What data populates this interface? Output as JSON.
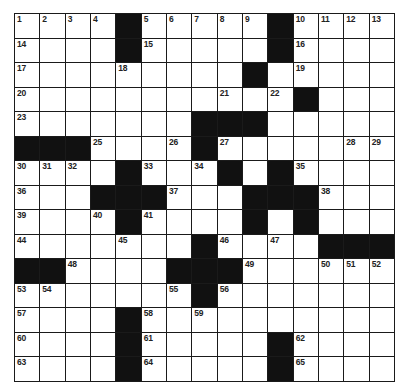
{
  "puzzle": {
    "type": "crossword",
    "rows": 15,
    "cols": 15,
    "colors": {
      "block": "#111111",
      "cell": "#ffffff",
      "line": "#1a1a1a",
      "number": "#222222"
    },
    "grid": [
      "....#.....#....",
      "....#.....#....",
      ".........#.....",
      "...........#...",
      ".......###.....",
      "###....#.......",
      "....#...#.#....",
      "...###...###...",
      "....#....#.#...",
      ".......#....###",
      "##....###......",
      ".......#.......",
      "....#..........",
      "....#.....#....",
      "....#.....#...."
    ],
    "numbers": [
      [
        1,
        2,
        3,
        4,
        0,
        5,
        6,
        7,
        8,
        9,
        0,
        10,
        11,
        12,
        13
      ],
      [
        14,
        0,
        0,
        0,
        0,
        15,
        0,
        0,
        0,
        0,
        0,
        16,
        0,
        0,
        0
      ],
      [
        17,
        0,
        0,
        0,
        18,
        0,
        0,
        0,
        0,
        0,
        0,
        19,
        0,
        0,
        0
      ],
      [
        20,
        0,
        0,
        0,
        0,
        0,
        0,
        0,
        21,
        0,
        22,
        0,
        0,
        0,
        0
      ],
      [
        23,
        0,
        0,
        0,
        0,
        0,
        0,
        0,
        0,
        24,
        0,
        0,
        0,
        0,
        0
      ],
      [
        0,
        0,
        0,
        25,
        0,
        0,
        26,
        0,
        27,
        0,
        0,
        0,
        0,
        28,
        29
      ],
      [
        30,
        31,
        32,
        0,
        0,
        33,
        0,
        34,
        0,
        0,
        0,
        35,
        0,
        0,
        0
      ],
      [
        36,
        0,
        0,
        0,
        0,
        0,
        37,
        0,
        0,
        0,
        0,
        0,
        38,
        0,
        0
      ],
      [
        39,
        0,
        0,
        40,
        0,
        41,
        0,
        0,
        0,
        42,
        0,
        43,
        0,
        0,
        0
      ],
      [
        44,
        0,
        0,
        0,
        45,
        0,
        0,
        0,
        46,
        0,
        47,
        0,
        0,
        0,
        0
      ],
      [
        0,
        0,
        48,
        0,
        0,
        0,
        0,
        0,
        0,
        49,
        0,
        0,
        50,
        51,
        52
      ],
      [
        53,
        54,
        0,
        0,
        0,
        0,
        55,
        0,
        56,
        0,
        0,
        0,
        0,
        0,
        0
      ],
      [
        57,
        0,
        0,
        0,
        0,
        58,
        0,
        59,
        0,
        0,
        0,
        0,
        0,
        0,
        0
      ],
      [
        60,
        0,
        0,
        0,
        0,
        61,
        0,
        0,
        0,
        0,
        0,
        62,
        0,
        0,
        0
      ],
      [
        63,
        0,
        0,
        0,
        0,
        64,
        0,
        0,
        0,
        0,
        0,
        65,
        0,
        0,
        0
      ]
    ]
  }
}
